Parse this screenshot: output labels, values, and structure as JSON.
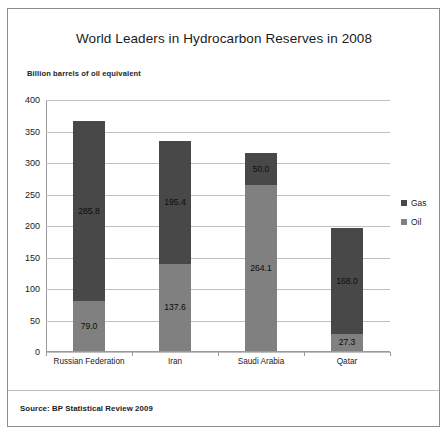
{
  "chart_data": {
    "type": "bar",
    "subtype": "stacked-vertical",
    "title": "World Leaders in Hydrocarbon Reserves in 2008",
    "subtitle": "Billion barrels of oil equivalent",
    "xlabel": "",
    "ylabel": "",
    "ylim": [
      0,
      400
    ],
    "ytick_values": [
      400,
      350,
      300,
      250,
      200,
      150,
      100,
      50,
      0
    ],
    "ytick_labels": [
      "400",
      "350",
      "300",
      "250",
      "200",
      "150",
      "100",
      "50",
      "0"
    ],
    "grid": true,
    "grid_axis": "y",
    "legend_position": "right",
    "categories": [
      "Russian Federation",
      "Iran",
      "Saudi Arabia",
      "Qatar"
    ],
    "series": [
      {
        "name": "Oil",
        "color": "#808080",
        "stack_order": 0,
        "values": [
          79.0,
          137.6,
          264.1,
          27.3
        ],
        "labels": [
          "79.0",
          "137.6",
          "264.1",
          "27.3"
        ]
      },
      {
        "name": "Gas",
        "color": "#484848",
        "stack_order": 1,
        "values": [
          285.8,
          195.4,
          50.0,
          168.0
        ],
        "labels": [
          "285.8",
          "195.4",
          "50.0",
          "168.0"
        ]
      }
    ],
    "totals": [
      364.8,
      333.0,
      314.1,
      195.3
    ],
    "source": "Source: BP Statistical Review 2009"
  },
  "legend": {
    "items": [
      {
        "label": "Gas",
        "color": "#484848"
      },
      {
        "label": "Oil",
        "color": "#808080"
      }
    ]
  },
  "colors": {
    "gas": "#484848",
    "oil": "#808080",
    "grid": "#bfbfbf",
    "axis": "#9a9a9a",
    "border": "#8c8c8c",
    "background": "#ffffff"
  }
}
